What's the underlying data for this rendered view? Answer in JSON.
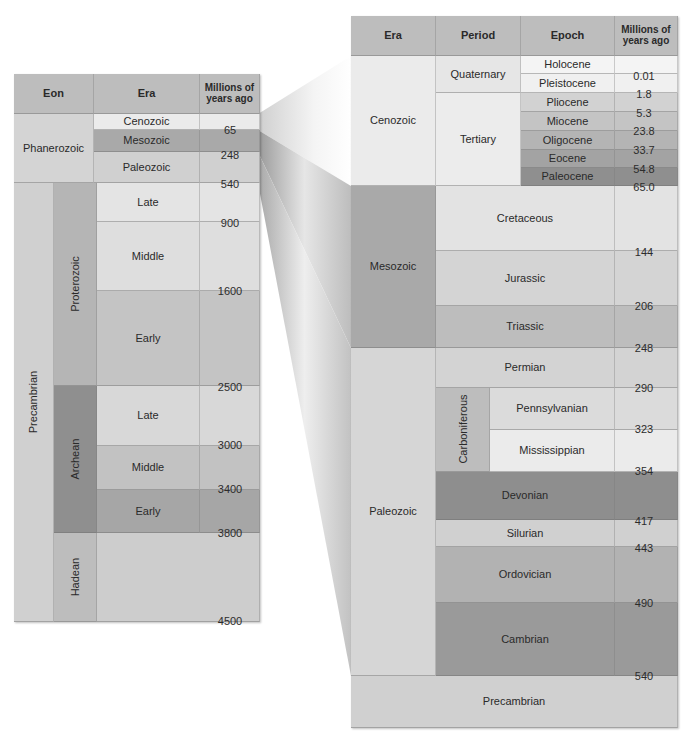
{
  "left_table": {
    "headers": {
      "eon": "Eon",
      "era": "Era",
      "myr": "Millions of years ago"
    },
    "eons": [
      {
        "name": "Phanerozoic"
      },
      {
        "name": "Precambrian"
      }
    ],
    "precambrian_eras": [
      {
        "name": "Proterozoic"
      },
      {
        "name": "Archean"
      },
      {
        "name": "Hadean"
      }
    ],
    "phanerozoic_eras": [
      {
        "name": "Cenozoic"
      },
      {
        "name": "Mesozoic"
      },
      {
        "name": "Paleozoic"
      }
    ],
    "proterozoic_subdivisions": [
      {
        "name": "Late"
      },
      {
        "name": "Middle"
      },
      {
        "name": "Early"
      }
    ],
    "archean_subdivisions": [
      {
        "name": "Late"
      },
      {
        "name": "Middle"
      },
      {
        "name": "Early"
      }
    ],
    "boundaries": [
      "65",
      "248",
      "540",
      "900",
      "1600",
      "2500",
      "3000",
      "3400",
      "3800",
      "4500"
    ]
  },
  "right_table": {
    "headers": {
      "era": "Era",
      "period": "Period",
      "epoch": "Epoch",
      "myr": "Millions of years ago"
    },
    "eras": [
      {
        "name": "Cenozoic"
      },
      {
        "name": "Mesozoic"
      },
      {
        "name": "Paleozoic"
      },
      {
        "name": "Precambrian"
      }
    ],
    "cenozoic_periods": [
      {
        "name": "Quaternary"
      },
      {
        "name": "Tertiary"
      }
    ],
    "epochs": [
      {
        "name": "Holocene"
      },
      {
        "name": "Pleistocene"
      },
      {
        "name": "Pliocene"
      },
      {
        "name": "Miocene"
      },
      {
        "name": "Oligocene"
      },
      {
        "name": "Eocene"
      },
      {
        "name": "Paleocene"
      }
    ],
    "mesozoic_periods": [
      {
        "name": "Cretaceous"
      },
      {
        "name": "Jurassic"
      },
      {
        "name": "Triassic"
      }
    ],
    "paleozoic_periods": [
      {
        "name": "Permian"
      },
      {
        "name": "Carboniferous"
      },
      {
        "name": "Devonian"
      },
      {
        "name": "Silurian"
      },
      {
        "name": "Ordovician"
      },
      {
        "name": "Cambrian"
      }
    ],
    "carboniferous_subperiods": [
      {
        "name": "Pennsylvanian"
      },
      {
        "name": "Mississippian"
      }
    ],
    "boundaries": [
      "0.01",
      "1.8",
      "5.3",
      "23.8",
      "33.7",
      "54.8",
      "65.0",
      "144",
      "206",
      "248",
      "290",
      "323",
      "354",
      "417",
      "443",
      "490",
      "540"
    ]
  },
  "colors": {
    "header": "#bdbdbd",
    "lightest": "#ececec",
    "light": "#e0e0e0",
    "mid_light": "#d3d3d3",
    "mid": "#c6c6c6",
    "mid_dark": "#b3b3b3",
    "dark": "#9e9e9e",
    "darker": "#8c8c8c"
  }
}
